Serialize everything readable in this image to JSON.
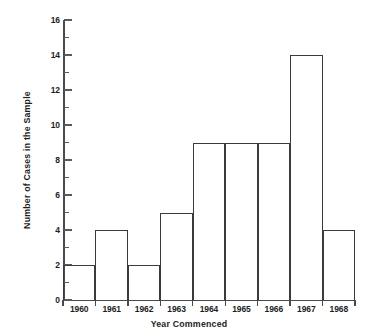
{
  "chart_data": {
    "type": "bar",
    "title": "",
    "xlabel": "Year Commenced",
    "ylabel": "Number of Cases in the Sample",
    "categories": [
      "1960",
      "1961",
      "1962",
      "1963",
      "1964",
      "1965",
      "1966",
      "1967",
      "1968"
    ],
    "values": [
      2,
      4,
      2,
      5,
      9,
      9,
      9,
      14,
      4
    ],
    "ylim": [
      0,
      16
    ],
    "y_major_ticks": [
      0,
      2,
      4,
      6,
      8,
      10,
      12,
      14,
      16
    ],
    "y_minor_ticks": [
      1,
      3,
      5,
      7,
      9,
      11,
      13,
      15
    ],
    "y_tick_labels": [
      "0",
      "2",
      "4",
      "6",
      "8",
      "10",
      "12",
      "14",
      "16"
    ],
    "grid": false,
    "legend": null,
    "series": [
      {
        "name": "Number of Cases in the Sample",
        "values": [
          2,
          4,
          2,
          5,
          9,
          9,
          9,
          14,
          4
        ]
      }
    ],
    "style": {
      "bar_fill": "#ffffff",
      "bar_stroke": "#3b3b3b",
      "axis_color": "#4a4a4a",
      "text_color": "#1d1d1d",
      "background": "#ffffff"
    }
  }
}
